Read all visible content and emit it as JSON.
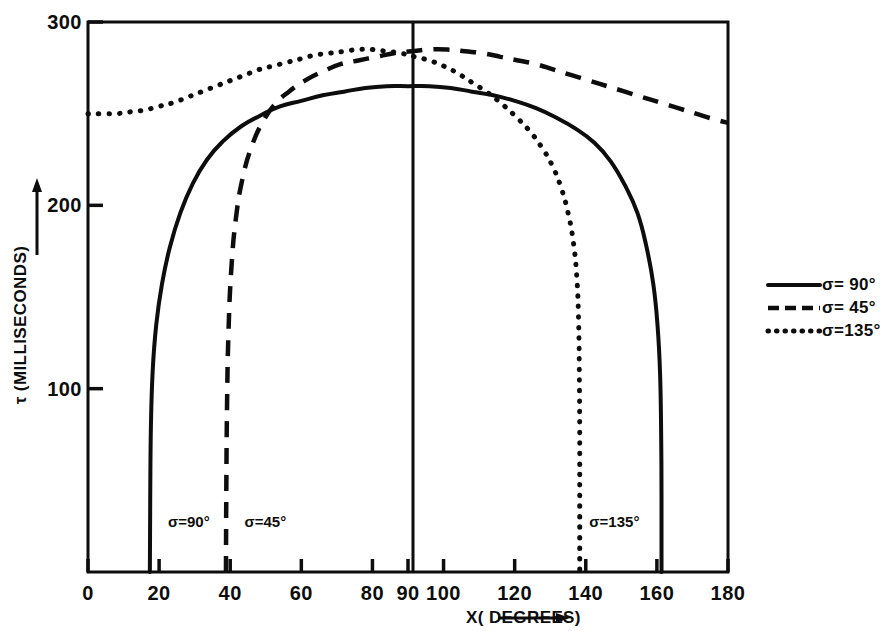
{
  "chart_data": {
    "type": "line",
    "title": "",
    "xlabel": "X( DEGREES)",
    "ylabel": "τ (MILLISECONDS)",
    "xlim": [
      0,
      180
    ],
    "ylim": [
      0,
      300
    ],
    "xticks": [
      0,
      20,
      40,
      60,
      80,
      90,
      100,
      120,
      140,
      160,
      180
    ],
    "xticklabels": [
      "0",
      "20",
      "40",
      "60",
      "80",
      "90",
      "100",
      "120",
      "140",
      "160",
      "180"
    ],
    "yticks": [
      100,
      200,
      300
    ],
    "yticklabels": [
      "100",
      "200",
      "300"
    ],
    "grid": false,
    "legend_position": "right-outside",
    "vertical_reference_line_x": 90,
    "series": [
      {
        "name": "σ= 90°",
        "style": "solid",
        "points": [
          [
            17.4,
            0
          ],
          [
            17.5,
            40
          ],
          [
            17.7,
            80
          ],
          [
            18.2,
            110
          ],
          [
            19.2,
            135
          ],
          [
            20.8,
            157
          ],
          [
            23.0,
            177
          ],
          [
            26.0,
            196
          ],
          [
            29.5,
            212
          ],
          [
            33.5,
            225
          ],
          [
            38.0,
            235
          ],
          [
            43.0,
            243
          ],
          [
            48.5,
            249
          ],
          [
            54.0,
            254
          ],
          [
            60.0,
            257
          ],
          [
            66.0,
            260
          ],
          [
            72.0,
            262
          ],
          [
            78.0,
            264
          ],
          [
            84.0,
            265
          ],
          [
            90.0,
            265
          ],
          [
            96.0,
            265
          ],
          [
            102.0,
            264
          ],
          [
            108.0,
            262
          ],
          [
            114.0,
            260
          ],
          [
            120.0,
            257
          ],
          [
            126.0,
            253
          ],
          [
            131.5,
            248
          ],
          [
            137.0,
            242
          ],
          [
            142.5,
            234
          ],
          [
            147.0,
            224
          ],
          [
            151.0,
            211
          ],
          [
            154.5,
            196
          ],
          [
            157.0,
            178
          ],
          [
            159.0,
            157
          ],
          [
            160.2,
            134
          ],
          [
            160.9,
            108
          ],
          [
            161.2,
            75
          ],
          [
            161.3,
            40
          ],
          [
            161.3,
            0
          ]
        ]
      },
      {
        "name": "σ= 45°",
        "style": "dashed",
        "points": [
          [
            38.8,
            0
          ],
          [
            38.9,
            45
          ],
          [
            39.1,
            90
          ],
          [
            39.5,
            130
          ],
          [
            40.3,
            165
          ],
          [
            41.6,
            193
          ],
          [
            43.5,
            215
          ],
          [
            46.0,
            232
          ],
          [
            49.0,
            245
          ],
          [
            52.5,
            255
          ],
          [
            56.5,
            262
          ],
          [
            61.0,
            268
          ],
          [
            66.0,
            273
          ],
          [
            71.0,
            277
          ],
          [
            76.0,
            279
          ],
          [
            81.0,
            281
          ],
          [
            86.0,
            283
          ],
          [
            91.0,
            284
          ],
          [
            96.0,
            285
          ],
          [
            101.0,
            285
          ],
          [
            106.0,
            284
          ],
          [
            111.0,
            283
          ],
          [
            116.0,
            281
          ],
          [
            121.0,
            279
          ],
          [
            126.0,
            277
          ],
          [
            131.0,
            274
          ],
          [
            136.0,
            271
          ],
          [
            141.0,
            268
          ],
          [
            146.0,
            265
          ],
          [
            151.0,
            262
          ],
          [
            156.0,
            259
          ],
          [
            161.0,
            256
          ],
          [
            166.0,
            253
          ],
          [
            171.0,
            250
          ],
          [
            176.0,
            247
          ],
          [
            180.0,
            245
          ]
        ]
      },
      {
        "name": "σ=135°",
        "style": "dotted",
        "points": [
          [
            0.0,
            250
          ],
          [
            4.0,
            250
          ],
          [
            8.0,
            250
          ],
          [
            12.0,
            251
          ],
          [
            16.0,
            252
          ],
          [
            20.0,
            254
          ],
          [
            24.0,
            256
          ],
          [
            28.0,
            259
          ],
          [
            32.0,
            262
          ],
          [
            36.0,
            265
          ],
          [
            40.0,
            268
          ],
          [
            44.0,
            271
          ],
          [
            48.0,
            274
          ],
          [
            52.0,
            276
          ],
          [
            56.0,
            278
          ],
          [
            60.0,
            280
          ],
          [
            64.0,
            282
          ],
          [
            68.0,
            283
          ],
          [
            72.0,
            284
          ],
          [
            76.0,
            285
          ],
          [
            80.0,
            285
          ],
          [
            84.0,
            284
          ],
          [
            88.0,
            283
          ],
          [
            92.0,
            281
          ],
          [
            96.0,
            279
          ],
          [
            100.0,
            276
          ],
          [
            104.0,
            272
          ],
          [
            108.0,
            267
          ],
          [
            112.0,
            262
          ],
          [
            116.0,
            256
          ],
          [
            120.0,
            249
          ],
          [
            124.0,
            241
          ],
          [
            127.5,
            232
          ],
          [
            130.5,
            222
          ],
          [
            133.0,
            210
          ],
          [
            135.0,
            196
          ],
          [
            136.5,
            180
          ],
          [
            137.5,
            160
          ],
          [
            138.0,
            135
          ],
          [
            138.2,
            105
          ],
          [
            138.3,
            70
          ],
          [
            138.3,
            35
          ],
          [
            138.3,
            0
          ]
        ]
      }
    ],
    "annotations": [
      {
        "text": "σ=90°",
        "x": 22.5,
        "y": 27
      },
      {
        "text": "σ=45°",
        "x": 44.0,
        "y": 27
      },
      {
        "text": "σ=135°",
        "x": 141.0,
        "y": 27
      }
    ],
    "legend_entries": [
      {
        "label": "σ= 90°",
        "style": "solid"
      },
      {
        "label": "σ= 45°",
        "style": "dashed"
      },
      {
        "label": "σ=135°",
        "style": "dotted"
      }
    ]
  },
  "colors": {
    "ink": "#0d0d0d",
    "background": "#ffffff"
  }
}
